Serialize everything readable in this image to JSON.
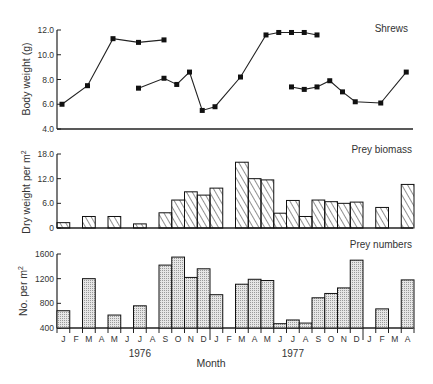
{
  "chart_data": [
    {
      "type": "line",
      "title": "Shrews",
      "xlabel": "",
      "ylabel": "Body weight (g)",
      "ylim": [
        4.0,
        12.0
      ],
      "yticks": [
        "12.0",
        "10.0",
        "8.0",
        "6.0",
        "4.0"
      ],
      "ytick_values": [
        12,
        10,
        8,
        6,
        4
      ],
      "grid": false,
      "series": [
        {
          "name": "cohort A 1976",
          "points": [
            [
              0,
              6.0
            ],
            [
              2,
              7.5
            ],
            [
              4,
              11.3
            ],
            [
              6,
              11.0
            ],
            [
              8,
              11.2
            ]
          ]
        },
        {
          "name": "cohort B 1976",
          "points": [
            [
              6,
              7.3
            ],
            [
              8,
              8.1
            ],
            [
              9,
              7.6
            ],
            [
              10,
              8.6
            ],
            [
              11,
              5.5
            ],
            [
              12,
              5.8
            ],
            [
              14,
              8.2
            ],
            [
              16,
              11.6
            ],
            [
              17,
              11.8
            ],
            [
              18,
              11.8
            ],
            [
              19,
              11.8
            ],
            [
              20,
              11.6
            ]
          ]
        },
        {
          "name": "cohort 1977",
          "points": [
            [
              18,
              7.4
            ],
            [
              19,
              7.2
            ],
            [
              20,
              7.4
            ],
            [
              21,
              7.9
            ],
            [
              22,
              7.0
            ],
            [
              23,
              6.2
            ],
            [
              25,
              6.1
            ],
            [
              27,
              8.6
            ]
          ]
        }
      ]
    },
    {
      "type": "bar",
      "title": "Prey biomass",
      "xlabel": "",
      "ylabel": "Dry weight per m²",
      "ylim": [
        0,
        18.0
      ],
      "yticks": [
        "18.0",
        "12.0",
        "6.0",
        "0"
      ],
      "ytick_values": [
        18,
        12,
        6,
        0
      ],
      "grid": false,
      "bars": [
        [
          0,
          1.3
        ],
        [
          2,
          2.8
        ],
        [
          4,
          2.8
        ],
        [
          6,
          1.0
        ],
        [
          8,
          3.7
        ],
        [
          9,
          6.8
        ],
        [
          10,
          8.8
        ],
        [
          11,
          8.0
        ],
        [
          12,
          9.7
        ],
        [
          14,
          16.0
        ],
        [
          15,
          12.0
        ],
        [
          16,
          11.7
        ],
        [
          17,
          3.6
        ],
        [
          18,
          6.7
        ],
        [
          19,
          2.8
        ],
        [
          20,
          6.8
        ],
        [
          21,
          6.4
        ],
        [
          22,
          6.0
        ],
        [
          23,
          6.3
        ],
        [
          25,
          5.0
        ],
        [
          27,
          10.6
        ]
      ]
    },
    {
      "type": "bar",
      "title": "Prey numbers",
      "xlabel": "Month",
      "ylabel": "No. per m²",
      "ylim": [
        400,
        1600
      ],
      "yticks": [
        "1600",
        "1200",
        "800",
        "400"
      ],
      "ytick_values": [
        1600,
        1200,
        800,
        400
      ],
      "grid": false,
      "bars": [
        [
          0,
          680
        ],
        [
          2,
          1200
        ],
        [
          4,
          610
        ],
        [
          6,
          760
        ],
        [
          8,
          1420
        ],
        [
          9,
          1550
        ],
        [
          10,
          1220
        ],
        [
          11,
          1360
        ],
        [
          12,
          940
        ],
        [
          14,
          1110
        ],
        [
          15,
          1190
        ],
        [
          16,
          1170
        ],
        [
          17,
          470
        ],
        [
          18,
          530
        ],
        [
          19,
          480
        ],
        [
          20,
          890
        ],
        [
          21,
          960
        ],
        [
          22,
          1050
        ],
        [
          23,
          1500
        ],
        [
          25,
          710
        ],
        [
          27,
          1180
        ]
      ]
    }
  ],
  "x_axis": {
    "months": [
      "J",
      "F",
      "M",
      "A",
      "M",
      "J",
      "J",
      "A",
      "S",
      "O",
      "N",
      "D",
      "J",
      "F",
      "M",
      "A",
      "M",
      "J",
      "J",
      "A",
      "S",
      "O",
      "N",
      "D",
      "J",
      "F",
      "M",
      "A"
    ],
    "years": [
      {
        "label": "1976",
        "center_month": 6.5
      },
      {
        "label": "1977",
        "center_month": 18.5
      }
    ],
    "label": "Month"
  },
  "panels": {
    "top_title": "Shrews",
    "mid_title": "Prey biomass",
    "bot_title": "Prey numbers",
    "top_ylabel": "Body weight (g)",
    "mid_ylabel": "Dry weight per m",
    "bot_ylabel": "No. per m",
    "sup": "2"
  }
}
